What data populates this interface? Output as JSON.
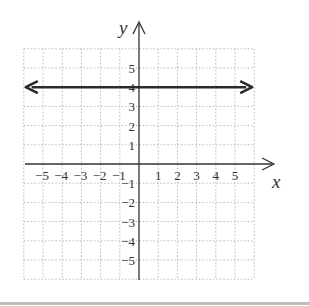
{
  "chart_data": {
    "type": "line",
    "title": "",
    "xlabel": "x",
    "ylabel": "y",
    "xlim": [
      -6,
      6
    ],
    "ylim": [
      -6,
      6
    ],
    "grid": true,
    "x_ticks": [
      "-5",
      "-4",
      "-3",
      "-2",
      "-1",
      "1",
      "2",
      "3",
      "4",
      "5"
    ],
    "y_ticks": [
      "5",
      "4",
      "3",
      "2",
      "1",
      "-1",
      "-2",
      "-3",
      "-4",
      "-5"
    ],
    "series": [
      {
        "name": "y = 4",
        "equation": "y = 4",
        "x": [
          -6,
          6
        ],
        "y": [
          4,
          4
        ],
        "arrows": "both"
      }
    ]
  },
  "labels": {
    "x_axis": "x",
    "y_axis": "y"
  },
  "colors": {
    "axis": "#333333",
    "line": "#2a2a2a",
    "grid": "#b8b8b8",
    "rule": "#bdbdbd"
  }
}
